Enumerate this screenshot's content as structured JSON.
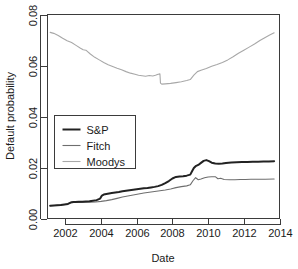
{
  "chart_data": {
    "type": "line",
    "title": "",
    "xlabel": "Date",
    "ylabel": "Default probability",
    "xlim": [
      2001.0,
      2014.0
    ],
    "ylim": [
      0.0,
      0.08
    ],
    "xticks": [
      2002,
      2004,
      2006,
      2008,
      2010,
      2012,
      2014
    ],
    "xticklabels": [
      "2002",
      "2004",
      "2006",
      "2008",
      "2010",
      "2012",
      "2014"
    ],
    "yticks": [
      0.0,
      0.02,
      0.04,
      0.06,
      0.08
    ],
    "yticklabels": [
      "0.00",
      "0.02",
      "0.04",
      "0.06",
      "0.08"
    ],
    "grid": false,
    "legend_position": "center-left",
    "series": [
      {
        "name": "S&P",
        "color": "#222222",
        "width": 2.0,
        "x": [
          2001.15,
          2001.35,
          2001.55,
          2001.75,
          2001.95,
          2002.15,
          2002.35,
          2002.45,
          2002.55,
          2002.75,
          2002.95,
          2003.15,
          2003.35,
          2003.55,
          2003.75,
          2003.95,
          2004.05,
          2004.15,
          2004.3,
          2004.45,
          2004.6,
          2004.8,
          2005.0,
          2005.2,
          2005.4,
          2005.6,
          2005.8,
          2006.0,
          2006.2,
          2006.4,
          2006.6,
          2006.8,
          2007.0,
          2007.2,
          2007.4,
          2007.6,
          2007.8,
          2008.0,
          2008.2,
          2008.4,
          2008.6,
          2008.8,
          2009.0,
          2009.1,
          2009.2,
          2009.3,
          2009.45,
          2009.6,
          2009.75,
          2009.9,
          2010.05,
          2010.2,
          2010.4,
          2010.6,
          2010.8,
          2011.0,
          2011.3,
          2011.6,
          2011.9,
          2012.2,
          2012.5,
          2012.8,
          2013.1,
          2013.4,
          2013.7
        ],
        "y": [
          0.005,
          0.0051,
          0.0052,
          0.0053,
          0.0055,
          0.0057,
          0.0064,
          0.0065,
          0.0065,
          0.0066,
          0.0066,
          0.0067,
          0.0068,
          0.007,
          0.0072,
          0.0078,
          0.009,
          0.0094,
          0.0096,
          0.0098,
          0.01,
          0.0102,
          0.0104,
          0.0107,
          0.0109,
          0.0111,
          0.0113,
          0.0115,
          0.0117,
          0.0119,
          0.012,
          0.0122,
          0.0124,
          0.0127,
          0.0132,
          0.0139,
          0.0147,
          0.0157,
          0.0163,
          0.0165,
          0.0166,
          0.0168,
          0.0172,
          0.0185,
          0.0198,
          0.0205,
          0.021,
          0.0218,
          0.0226,
          0.0229,
          0.0225,
          0.0219,
          0.0216,
          0.0215,
          0.0216,
          0.0218,
          0.022,
          0.0221,
          0.0222,
          0.0222,
          0.0223,
          0.0223,
          0.0224,
          0.0224,
          0.0225
        ]
      },
      {
        "name": "Fitch",
        "color": "#6e6e6e",
        "width": 1.1,
        "x": [
          2001.15,
          2001.4,
          2001.7,
          2002.0,
          2002.3,
          2002.5,
          2002.8,
          2003.1,
          2003.4,
          2003.7,
          2004.0,
          2004.3,
          2004.6,
          2004.9,
          2005.2,
          2005.5,
          2005.8,
          2006.1,
          2006.4,
          2006.7,
          2007.0,
          2007.3,
          2007.6,
          2007.9,
          2008.2,
          2008.5,
          2008.8,
          2009.0,
          2009.15,
          2009.3,
          2009.45,
          2009.6,
          2009.8,
          2010.0,
          2010.2,
          2010.4,
          2010.55,
          2010.7,
          2010.9,
          2011.2,
          2011.5,
          2011.8,
          2012.1,
          2012.4,
          2012.8,
          2013.2,
          2013.7
        ],
        "y": [
          0.005,
          0.0051,
          0.0053,
          0.0055,
          0.0062,
          0.0063,
          0.0063,
          0.0064,
          0.0064,
          0.0065,
          0.0067,
          0.007,
          0.0074,
          0.0079,
          0.0084,
          0.0088,
          0.0092,
          0.0096,
          0.01,
          0.0103,
          0.0106,
          0.0109,
          0.0112,
          0.0116,
          0.0121,
          0.0125,
          0.0128,
          0.0132,
          0.0148,
          0.016,
          0.0152,
          0.0155,
          0.016,
          0.0163,
          0.0164,
          0.0164,
          0.0156,
          0.0158,
          0.0153,
          0.0152,
          0.0152,
          0.0153,
          0.0153,
          0.0154,
          0.0154,
          0.0154,
          0.0155
        ]
      },
      {
        "name": "Moodys",
        "color": "#a8a8a8",
        "width": 1.1,
        "x": [
          2001.15,
          2001.35,
          2001.6,
          2001.85,
          2002.1,
          2002.35,
          2002.6,
          2002.85,
          2003.0,
          2003.15,
          2003.4,
          2003.65,
          2003.9,
          2004.15,
          2004.4,
          2004.65,
          2004.9,
          2005.15,
          2005.4,
          2005.65,
          2005.9,
          2006.1,
          2006.3,
          2006.5,
          2006.7,
          2006.9,
          2007.05,
          2007.2,
          2007.3,
          2007.33,
          2007.4,
          2007.6,
          2007.9,
          2008.2,
          2008.5,
          2008.8,
          2009.0,
          2009.2,
          2009.4,
          2009.6,
          2009.9,
          2010.2,
          2010.5,
          2010.8,
          2011.1,
          2011.4,
          2011.7,
          2012.0,
          2012.3,
          2012.6,
          2012.9,
          2013.2,
          2013.45,
          2013.7
        ],
        "y": [
          0.073,
          0.0726,
          0.0718,
          0.0707,
          0.0697,
          0.069,
          0.0679,
          0.0668,
          0.0662,
          0.066,
          0.0645,
          0.0632,
          0.0622,
          0.0612,
          0.0603,
          0.0596,
          0.0589,
          0.0583,
          0.0576,
          0.057,
          0.0566,
          0.0562,
          0.056,
          0.0558,
          0.0561,
          0.0559,
          0.0562,
          0.0566,
          0.0567,
          0.0531,
          0.0527,
          0.0528,
          0.053,
          0.0533,
          0.0536,
          0.0541,
          0.0545,
          0.0562,
          0.0576,
          0.0581,
          0.0588,
          0.0597,
          0.0604,
          0.0612,
          0.0622,
          0.0634,
          0.0648,
          0.066,
          0.0672,
          0.0684,
          0.0698,
          0.071,
          0.072,
          0.0728
        ]
      }
    ]
  },
  "legend": {
    "items": [
      {
        "label": "S&P"
      },
      {
        "label": "Fitch"
      },
      {
        "label": "Moodys"
      }
    ]
  }
}
